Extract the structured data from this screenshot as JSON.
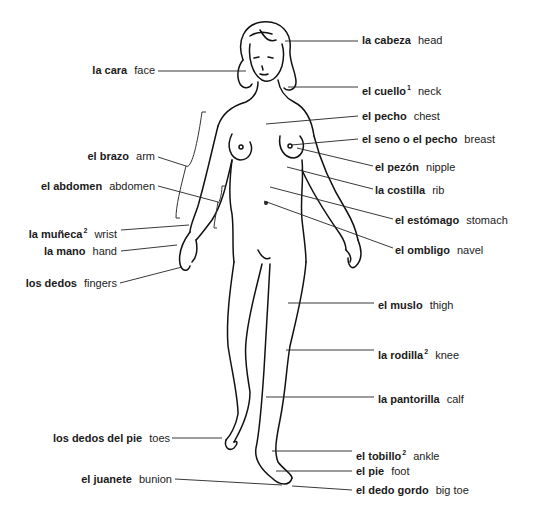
{
  "diagram": {
    "type": "anatomy-figure",
    "colors": {
      "ink": "#111111",
      "background": "#ffffff"
    }
  },
  "labels": [
    {
      "id": "la-cabeza",
      "es": "la cabeza",
      "sup": "",
      "en": "head",
      "side": "right",
      "x": 362,
      "y": 34,
      "line": [
        285,
        41,
        358,
        41
      ]
    },
    {
      "id": "la-cara",
      "es": "la cara",
      "sup": "",
      "en": "face",
      "side": "left",
      "x": 155,
      "y": 64,
      "line": [
        158,
        71,
        246,
        71
      ]
    },
    {
      "id": "el-cuello",
      "es": "el cuello",
      "sup": "1",
      "en": "neck",
      "side": "right",
      "x": 362,
      "y": 81,
      "line": [
        288,
        87,
        358,
        87
      ]
    },
    {
      "id": "el-pecho",
      "es": "el pecho",
      "sup": "",
      "en": "chest",
      "side": "right",
      "x": 362,
      "y": 110,
      "line": [
        266,
        124,
        358,
        116
      ]
    },
    {
      "id": "el-seno",
      "es": "el seno o el pecho",
      "sup": "",
      "en": "breast",
      "side": "right",
      "x": 362,
      "y": 133,
      "line": [
        291,
        145,
        358,
        139
      ]
    },
    {
      "id": "el-pezon",
      "es": "el pezón",
      "sup": "",
      "en": "nipple",
      "side": "right",
      "x": 375,
      "y": 161,
      "line": [
        297,
        148,
        373,
        166
      ]
    },
    {
      "id": "la-costilla",
      "es": "la costilla",
      "sup": "",
      "en": "rib",
      "side": "right",
      "x": 375,
      "y": 184,
      "line": [
        287,
        167,
        373,
        189
      ]
    },
    {
      "id": "el-estomago",
      "es": "el estómago",
      "sup": "",
      "en": "stomach",
      "side": "right",
      "x": 395,
      "y": 214,
      "line": [
        270,
        187,
        393,
        219
      ]
    },
    {
      "id": "el-ombligo",
      "es": "el ombligo",
      "sup": "",
      "en": "navel",
      "side": "right",
      "x": 395,
      "y": 244,
      "line": [
        264,
        201,
        393,
        248
      ]
    },
    {
      "id": "el-brazo",
      "es": "el brazo",
      "sup": "",
      "en": "arm",
      "side": "left",
      "x": 155,
      "y": 150,
      "line": [
        158,
        157,
        186,
        166
      ]
    },
    {
      "id": "el-abdomen",
      "es": "el abdomen",
      "sup": "",
      "en": "abdomen",
      "side": "left",
      "x": 155,
      "y": 180,
      "line": [
        158,
        186,
        218,
        202
      ]
    },
    {
      "id": "la-muneca",
      "es": "la muñeca",
      "sup": "2",
      "en": "wrist",
      "side": "left",
      "x": 117,
      "y": 224,
      "line": [
        121,
        230,
        189,
        225
      ]
    },
    {
      "id": "la-mano",
      "es": "la mano",
      "sup": "",
      "en": "hand",
      "side": "left",
      "x": 117,
      "y": 245,
      "line": [
        121,
        251,
        177,
        245
      ]
    },
    {
      "id": "los-dedos",
      "es": "los dedos",
      "sup": "",
      "en": "fingers",
      "side": "left",
      "x": 117,
      "y": 277,
      "line": [
        120,
        283,
        182,
        267
      ]
    },
    {
      "id": "el-muslo",
      "es": "el muslo",
      "sup": "",
      "en": "thigh",
      "side": "right",
      "x": 378,
      "y": 299,
      "line": [
        288,
        303,
        374,
        303
      ]
    },
    {
      "id": "la-rodilla",
      "es": "la rodilla",
      "sup": "2",
      "en": "knee",
      "side": "right",
      "x": 378,
      "y": 345,
      "line": [
        286,
        350,
        374,
        350
      ]
    },
    {
      "id": "la-pantorrilla",
      "es": "la pantorilla",
      "sup": "",
      "en": "calf",
      "side": "right",
      "x": 378,
      "y": 393,
      "line": [
        266,
        397,
        374,
        397
      ]
    },
    {
      "id": "los-dedos-del-pie",
      "es": "los dedos del pie",
      "sup": "",
      "en": "toes",
      "side": "left",
      "x": 170,
      "y": 432,
      "line": [
        172,
        438,
        222,
        438
      ]
    },
    {
      "id": "el-tobillo",
      "es": "el tobillo",
      "sup": "2",
      "en": "ankle",
      "side": "right",
      "x": 356,
      "y": 446,
      "line": [
        272,
        451,
        352,
        451
      ]
    },
    {
      "id": "el-pie",
      "es": "el pie",
      "sup": "",
      "en": "foot",
      "side": "right",
      "x": 356,
      "y": 465,
      "line": [
        276,
        471,
        352,
        471
      ]
    },
    {
      "id": "el-juanete",
      "es": "el juanete",
      "sup": "",
      "en": "bunion",
      "side": "left",
      "x": 172,
      "y": 473,
      "line": [
        175,
        479,
        282,
        485
      ]
    },
    {
      "id": "el-dedo-gordo",
      "es": "el dedo gordo",
      "sup": "",
      "en": "big toe",
      "side": "right",
      "x": 356,
      "y": 484,
      "line": [
        292,
        486,
        352,
        490
      ]
    }
  ]
}
